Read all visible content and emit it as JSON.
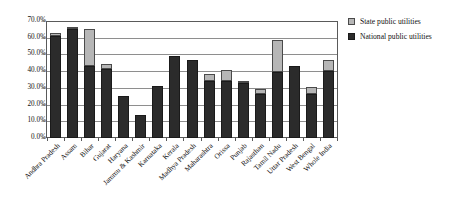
{
  "chart_data": {
    "type": "bar",
    "title": "",
    "subtitle": "",
    "xlabel": "",
    "ylabel": "",
    "ylim": [
      0,
      70
    ],
    "ytick_labels": [
      "0.0%",
      "10.0%",
      "20.0%",
      "30.0%",
      "40.0%",
      "50.0%",
      "60.0%",
      "70.0%"
    ],
    "ytick_values": [
      0,
      10,
      20,
      30,
      40,
      50,
      60,
      70
    ],
    "grid": true,
    "stacked": true,
    "legend_position": "top-right",
    "categories": [
      "Andhra Pradesh",
      "Assam",
      "Bihar",
      "Gujarat",
      "Haryana",
      "Jammu & Kashmir",
      "Karnataka",
      "Kerala",
      "Madhya Pradesh",
      "Maharashtra",
      "Orissa",
      "Punjab",
      "Rajasthan",
      "Tamil Nadu",
      "Uttar Pradesh",
      "West Bengal",
      "Whole India"
    ],
    "series": [
      {
        "name": "National public utilities",
        "color": "#2b2b2b",
        "values": [
          61.2,
          65.3,
          43.0,
          41.2,
          25.2,
          13.5,
          31.0,
          48.8,
          46.6,
          34.2,
          34.0,
          32.8,
          26.5,
          39.5,
          43.0,
          26.5,
          40.1
        ]
      },
      {
        "name": "State public utilities",
        "color": "#b6b6b6",
        "values": [
          1.4,
          0.5,
          22.5,
          3.3,
          0.0,
          0.0,
          0.0,
          0.0,
          0.0,
          4.1,
          6.5,
          0.6,
          2.6,
          19.0,
          0.0,
          4.0,
          6.4
        ]
      }
    ],
    "totals": [
      62.6,
      65.8,
      65.5,
      44.5,
      25.2,
      13.5,
      31.0,
      48.8,
      46.6,
      38.3,
      40.5,
      33.4,
      29.1,
      58.5,
      43.0,
      30.5,
      46.5
    ]
  },
  "legend": {
    "items": [
      {
        "label": "State public utilities",
        "swatch": "state-swatch"
      },
      {
        "label": "National public utilities",
        "swatch": "national-swatch"
      }
    ]
  }
}
